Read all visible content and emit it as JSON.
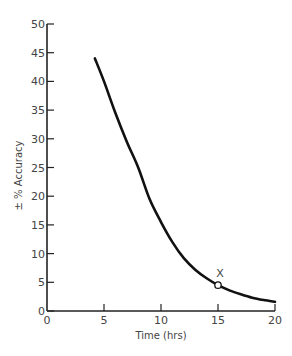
{
  "chart_data": {
    "type": "line",
    "title": "",
    "xlabel": "Time (hrs)",
    "ylabel": "± % Accuracy",
    "xlim": [
      0,
      20
    ],
    "ylim": [
      0,
      50
    ],
    "x_ticks": [
      0,
      5,
      10,
      15,
      20
    ],
    "y_ticks": [
      0,
      5,
      10,
      15,
      20,
      25,
      30,
      35,
      40,
      45,
      50
    ],
    "grid": false,
    "legend": null,
    "series": [
      {
        "name": "accuracy",
        "x": [
          4.2,
          5,
          6,
          7,
          8,
          9,
          10,
          11,
          12,
          13,
          14,
          15,
          16,
          17,
          18,
          19,
          20
        ],
        "values": [
          44,
          40,
          34.5,
          29.5,
          25,
          19.5,
          15.5,
          12,
          9.2,
          7.2,
          5.7,
          4.5,
          3.6,
          2.9,
          2.3,
          1.9,
          1.6
        ]
      }
    ],
    "annotations": [
      {
        "text": "X",
        "x": 15,
        "y": 4.5,
        "marker": "open-circle"
      }
    ]
  }
}
